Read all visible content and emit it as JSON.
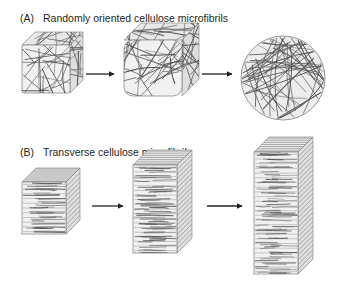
{
  "figure": {
    "width": 341,
    "height": 294,
    "background": "#ffffff",
    "line_color": "#58595b",
    "fibril_color": "#6d6e71",
    "fibril_color_dark": "#4d4e50",
    "face_fill": "#f1f1f1",
    "face_fill_top": "#e8e8e8",
    "face_fill_side": "#dedede",
    "sphere_fill": "#ededed",
    "outline_color": "#8c8c8c",
    "arrow_color": "#231f20",
    "text_color": "#231f20"
  },
  "panels": [
    {
      "id": "panel-a",
      "letter": "(A)",
      "title": "Randomly oriented cellulose microfibrils",
      "letter_x": 20,
      "letter_y": 22,
      "title_x": 43,
      "title_y": 22,
      "fibril_type": "random",
      "stages": [
        {
          "name": "stage-small-cube",
          "shape": "cube",
          "x": 22,
          "y": 45,
          "w": 48,
          "h": 48,
          "depth": 13,
          "round": 2,
          "fibrils": 26
        },
        {
          "name": "stage-medium-cube",
          "shape": "cube",
          "x": 124,
          "y": 40,
          "w": 58,
          "h": 56,
          "depth": 17,
          "round": 9,
          "fibrils": 34
        },
        {
          "name": "stage-sphere",
          "shape": "sphere",
          "cx": 283,
          "cy": 78,
          "r": 42,
          "fibrils": 46
        }
      ],
      "arrows": [
        {
          "name": "arrow-1",
          "x1": 86,
          "y1": 74,
          "x2": 114,
          "y2": 74
        },
        {
          "name": "arrow-2",
          "x1": 202,
          "y1": 74,
          "x2": 232,
          "y2": 74
        }
      ]
    },
    {
      "id": "panel-b",
      "letter": "(B)",
      "title": "Transverse cellulose microfibrils",
      "letter_x": 20,
      "letter_y": 156,
      "title_x": 43,
      "title_y": 156,
      "fibril_type": "transverse",
      "stages": [
        {
          "name": "stage-short-box",
          "shape": "box",
          "x": 22,
          "y": 182,
          "w": 44,
          "h": 52,
          "depth": 14,
          "layers": 11
        },
        {
          "name": "stage-tall-box",
          "shape": "box",
          "x": 133,
          "y": 165,
          "w": 44,
          "h": 88,
          "depth": 15,
          "layers": 19
        },
        {
          "name": "stage-tallest-box",
          "shape": "box",
          "x": 254,
          "y": 152,
          "w": 44,
          "h": 122,
          "depth": 15,
          "layers": 26
        }
      ],
      "arrows": [
        {
          "name": "arrow-3",
          "x1": 92,
          "y1": 206,
          "x2": 123,
          "y2": 206
        },
        {
          "name": "arrow-4",
          "x1": 207,
          "y1": 206,
          "x2": 242,
          "y2": 206
        }
      ]
    }
  ]
}
